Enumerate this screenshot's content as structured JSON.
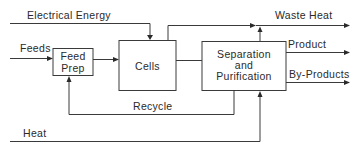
{
  "diagram": {
    "type": "process-flow",
    "nodes": [
      {
        "id": "feed_prep",
        "label_line1": "Feed",
        "label_line2": "Prep"
      },
      {
        "id": "cells",
        "label": "Cells"
      },
      {
        "id": "separation",
        "label_line1": "Separation",
        "label_line2": "and",
        "label_line3": "Purification"
      }
    ],
    "inputs": {
      "electrical_energy": "Electrical Energy",
      "feeds": "Feeds",
      "heat": "Heat"
    },
    "outputs": {
      "waste_heat": "Waste Heat",
      "product": "Product",
      "by_products": "By-Products"
    },
    "loops": {
      "recycle": "Recycle"
    },
    "edges": [
      {
        "from": "Feeds",
        "to": "feed_prep"
      },
      {
        "from": "feed_prep",
        "to": "cells"
      },
      {
        "from": "Electrical Energy",
        "to": "cells"
      },
      {
        "from": "cells",
        "to": "separation"
      },
      {
        "from": "cells",
        "to": "Waste Heat"
      },
      {
        "from": "separation",
        "to": "Waste Heat"
      },
      {
        "from": "separation",
        "to": "Product"
      },
      {
        "from": "separation",
        "to": "By-Products"
      },
      {
        "from": "separation",
        "to": "feed_prep",
        "label": "Recycle"
      },
      {
        "from": "Heat",
        "to": "separation"
      }
    ]
  }
}
